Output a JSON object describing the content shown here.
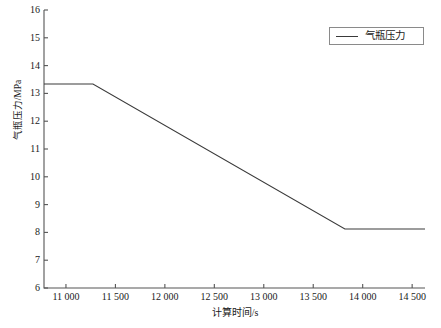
{
  "chart_data": {
    "type": "line",
    "title": "",
    "xlabel": "计算时间/s",
    "ylabel": "气瓶压力/MPa",
    "xlim": [
      10778,
      14630
    ],
    "ylim": [
      6,
      16
    ],
    "grid": false,
    "legend_position": "top-right",
    "xticks": [
      11000,
      11500,
      12000,
      12500,
      13000,
      13500,
      14000,
      14500
    ],
    "xtick_labels": [
      "11 000",
      "11 500",
      "12 000",
      "12 500",
      "13 000",
      "13 500",
      "14 000",
      "14 500"
    ],
    "yticks": [
      6,
      7,
      8,
      9,
      10,
      11,
      12,
      13,
      14,
      15,
      16
    ],
    "ytick_labels": [
      "6",
      "7",
      "8",
      "9",
      "10",
      "11",
      "12",
      "13",
      "14",
      "15",
      "16"
    ],
    "series": [
      {
        "name": "气瓶压力",
        "color": "#3a3a3a",
        "line_width": 1.1,
        "x": [
          10778,
          11273,
          13820,
          14630
        ],
        "values": [
          13.34,
          13.34,
          8.12,
          8.12
        ]
      }
    ],
    "legend": [
      "气瓶压力"
    ],
    "axis_color": "#555555",
    "background": "#ffffff"
  },
  "figure": {
    "y_axis_title": "气瓶压力/MPa",
    "x_axis_title": "计算时间/s"
  },
  "legend": {
    "entry_label": "气瓶压力"
  }
}
